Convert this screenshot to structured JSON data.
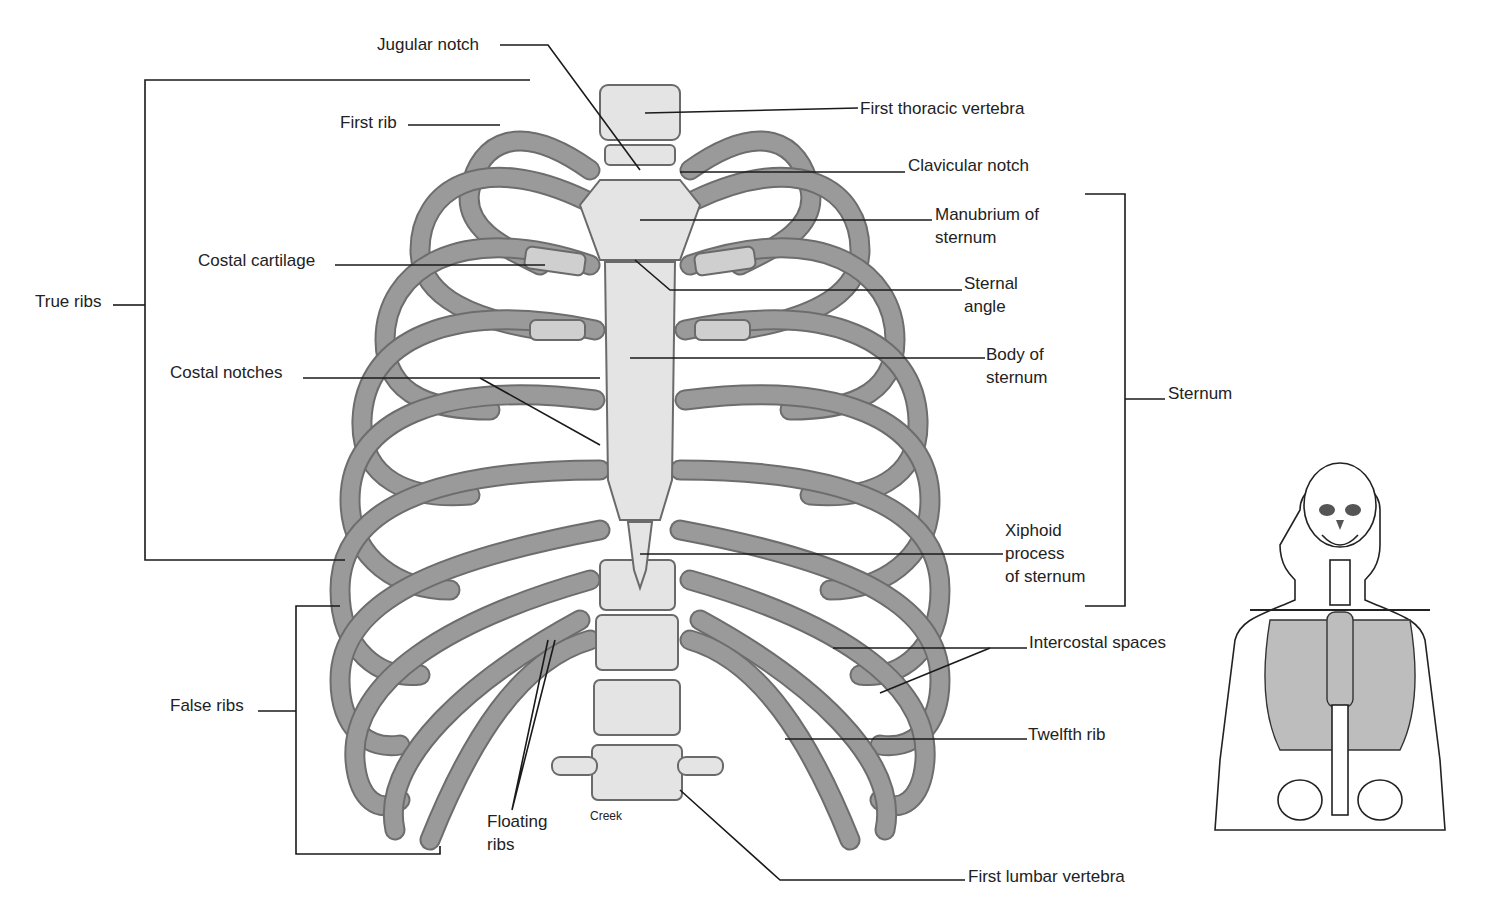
{
  "figure": {
    "credit": "Creek",
    "colors": {
      "background": "#ffffff",
      "label_text": "#222222",
      "leader_lines": "#1a1a1a",
      "bone_fill": "#e4e4e4",
      "bone_shade": "#9a9a9a"
    }
  },
  "labels": {
    "jugular_notch": "Jugular notch",
    "first_rib": "First rib",
    "first_thoracic_vertebra": "First thoracic vertebra",
    "clavicular_notch": "Clavicular notch",
    "manubrium": [
      "Manubrium of",
      "sternum"
    ],
    "costal_cartilage": "Costal cartilage",
    "sternal_angle": [
      "Sternal",
      "angle"
    ],
    "true_ribs": "True ribs",
    "body_of_sternum": [
      "Body of",
      "sternum"
    ],
    "costal_notches": "Costal notches",
    "sternum": "Sternum",
    "xiphoid_process": [
      "Xiphoid",
      "process",
      "of sternum"
    ],
    "intercostal_spaces": "Intercostal spaces",
    "false_ribs": "False ribs",
    "twelfth_rib": "Twelfth rib",
    "floating_ribs": [
      "Floating",
      "ribs"
    ],
    "first_lumbar_vertebra": "First lumbar vertebra"
  },
  "inset": {
    "description": "Full-body skeleton silhouette with thoracic cage highlighted"
  }
}
